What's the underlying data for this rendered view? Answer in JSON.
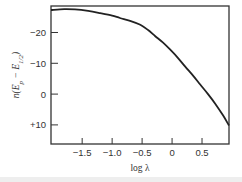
{
  "chart_data": {
    "type": "line",
    "title": "",
    "xlabel": "log λ",
    "ylabel": "n(E_p − E_1/2)",
    "ylabel_parts": {
      "main": "n(E",
      "sub1": "p",
      "mid": " − E",
      "sub2": "1/2",
      "end": ")"
    },
    "xlim": [
      -2.02,
      0.95
    ],
    "ylim": [
      16.2,
      -28.6
    ],
    "y_inverted": true,
    "grid": false,
    "legend": "none",
    "x_ticks": [
      {
        "value": -1.5,
        "label": "−1.5"
      },
      {
        "value": -1.0,
        "label": "−1.0"
      },
      {
        "value": -0.5,
        "label": "−0.5"
      },
      {
        "value": 0,
        "label": "0"
      },
      {
        "value": 0.5,
        "label": "0.5"
      }
    ],
    "y_ticks": [
      {
        "value": -20,
        "label": "−20"
      },
      {
        "value": -10,
        "label": "−10"
      },
      {
        "value": 0,
        "label": "0"
      },
      {
        "value": 10,
        "label": "+10"
      }
    ],
    "series": [
      {
        "name": "curve",
        "color": "#222222",
        "x": [
          -2.02,
          -1.8,
          -1.62,
          -1.4,
          -1.2,
          -1.0,
          -0.87,
          -0.7,
          -0.53,
          -0.4,
          -0.28,
          -0.15,
          -0.03,
          0.1,
          0.22,
          0.35,
          0.47,
          0.6,
          0.72,
          0.85,
          0.95
        ],
        "y": [
          -27.3,
          -27.6,
          -27.5,
          -27.0,
          -26.3,
          -25.5,
          -24.7,
          -23.8,
          -22.5,
          -20.8,
          -18.8,
          -16.7,
          -14.4,
          -11.7,
          -8.9,
          -6.0,
          -3.1,
          0.0,
          3.1,
          6.9,
          10.2
        ]
      }
    ]
  }
}
